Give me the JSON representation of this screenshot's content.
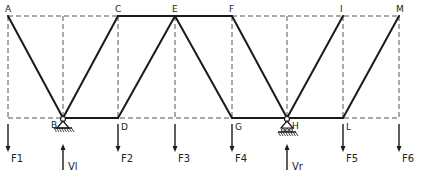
{
  "diagram": {
    "type": "truss",
    "top_nodes": [
      {
        "id": "A",
        "label": "A"
      },
      {
        "id": "C",
        "label": "C"
      },
      {
        "id": "E",
        "label": "E"
      },
      {
        "id": "F",
        "label": "F"
      },
      {
        "id": "I",
        "label": "I"
      },
      {
        "id": "M",
        "label": "M"
      }
    ],
    "bottom_nodes": [
      {
        "id": "B",
        "label": "B"
      },
      {
        "id": "D",
        "label": "D"
      },
      {
        "id": "G",
        "label": "G"
      },
      {
        "id": "H",
        "label": "H"
      },
      {
        "id": "L",
        "label": "L"
      }
    ],
    "members": [
      [
        "A",
        "B"
      ],
      [
        "C",
        "B"
      ],
      [
        "E",
        "D"
      ],
      [
        "E",
        "G"
      ],
      [
        "F",
        "H"
      ],
      [
        "I",
        "H"
      ],
      [
        "M",
        "L"
      ],
      [
        "C",
        "E"
      ],
      [
        "E",
        "F"
      ],
      [
        "B",
        "D"
      ],
      [
        "G",
        "H"
      ],
      [
        "H",
        "L"
      ]
    ],
    "supports": [
      {
        "node": "B",
        "type": "pin"
      },
      {
        "node": "H",
        "type": "roller"
      }
    ],
    "loads": [
      {
        "label": "F1",
        "direction": "down"
      },
      {
        "label": "F2",
        "direction": "down"
      },
      {
        "label": "F3",
        "direction": "down"
      },
      {
        "label": "F4",
        "direction": "down"
      },
      {
        "label": "F5",
        "direction": "down"
      },
      {
        "label": "F6",
        "direction": "down"
      }
    ],
    "reactions": [
      {
        "label": "Vl",
        "node": "B",
        "direction": "up"
      },
      {
        "label": "Vr",
        "node": "H",
        "direction": "up"
      }
    ],
    "colors": {
      "ink": "#1a1a1a",
      "dash": "#555555"
    }
  }
}
